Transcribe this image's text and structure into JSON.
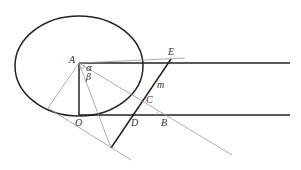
{
  "diagram": {
    "colors": {
      "thick_line": "#222222",
      "thin_line": "#999999",
      "background": "#ffffff"
    },
    "labels": {
      "A": "A",
      "E": "E",
      "alpha": "α",
      "beta": "β",
      "m": "m",
      "C": "C",
      "O": "O",
      "D": "D",
      "B": "B"
    },
    "points": {
      "A": [
        79,
        63
      ],
      "O": [
        79,
        115
      ],
      "E": [
        171,
        59
      ],
      "C": [
        146,
        102
      ],
      "D": [
        133,
        115
      ],
      "B": [
        165,
        115
      ],
      "lower_vertex": [
        111,
        148
      ]
    },
    "ellipse": {
      "cx": 79,
      "cy": 66,
      "rx": 64,
      "ry": 50
    }
  }
}
